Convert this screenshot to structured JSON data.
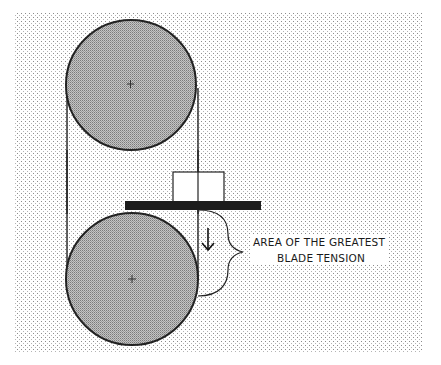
{
  "diagram": {
    "annotation": {
      "line1": "AREA OF THE GREATEST",
      "line2": "BLADE TENSION"
    },
    "components": {
      "upper_wheel": {
        "cx": 131,
        "cy": 85,
        "r": 65
      },
      "lower_wheel": {
        "cx": 132,
        "cy": 279,
        "r": 66
      },
      "table": {
        "x": 125,
        "y": 201,
        "width": 136,
        "height": 9
      },
      "blade_guide_block": {
        "x": 173,
        "y": 172,
        "width": 51,
        "height": 30
      },
      "blade_left_x": 67,
      "blade_right_x": 198
    },
    "colors": {
      "background_dots": "#9a9a9a",
      "wheel_fill": "#a8a8a8",
      "outline": "#222222",
      "table": "#1c1c1c",
      "block_fill": "#ffffff"
    }
  }
}
